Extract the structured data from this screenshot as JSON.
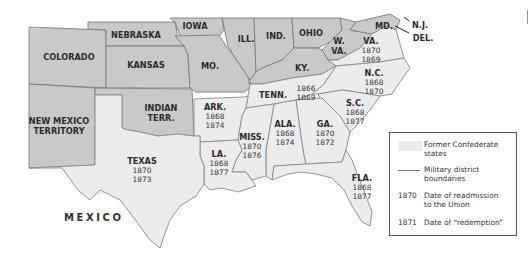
{
  "map": {
    "union_states": [
      {
        "id": "colorado",
        "label": "COLORADO"
      },
      {
        "id": "nebraska",
        "label": "NEBRASKA"
      },
      {
        "id": "iowa",
        "label": "IOWA"
      },
      {
        "id": "kansas",
        "label": "KANSAS"
      },
      {
        "id": "missouri",
        "label": "MO."
      },
      {
        "id": "illinois",
        "label": "ILL."
      },
      {
        "id": "indiana",
        "label": "IND."
      },
      {
        "id": "ohio",
        "label": "OHIO"
      },
      {
        "id": "west-virginia",
        "label_line1": "W.",
        "label_line2": "VA."
      },
      {
        "id": "kentucky",
        "label": "KY."
      },
      {
        "id": "maryland",
        "label": "MD."
      },
      {
        "id": "new-jersey",
        "label": "N.J."
      },
      {
        "id": "delaware",
        "label": "DEL."
      },
      {
        "id": "new-mexico",
        "label_line1": "NEW MEXICO",
        "label_line2": "TERRITORY"
      },
      {
        "id": "indian-territory",
        "label_line1": "INDIAN",
        "label_line2": "TERR."
      }
    ],
    "confederate_states": [
      {
        "id": "virginia",
        "label": "VA.",
        "readmission": "1870",
        "redemption": "1869"
      },
      {
        "id": "north-carolina",
        "label": "N.C.",
        "readmission": "1868",
        "redemption": "1870"
      },
      {
        "id": "tennessee",
        "label": "TENN.",
        "readmission": "1866",
        "redemption": "1869"
      },
      {
        "id": "south-carolina",
        "label": "S.C.",
        "readmission": "1868",
        "redemption": "1877"
      },
      {
        "id": "arkansas",
        "label": "ARK.",
        "readmission": "1868",
        "redemption": "1874"
      },
      {
        "id": "georgia",
        "label": "GA.",
        "readmission": "1870",
        "redemption": "1872"
      },
      {
        "id": "alabama",
        "label": "ALA.",
        "readmission": "1868",
        "redemption": "1874"
      },
      {
        "id": "mississippi",
        "label": "MISS.",
        "readmission": "1870",
        "redemption": "1876"
      },
      {
        "id": "louisiana",
        "label": "LA.",
        "readmission": "1868",
        "redemption": "1877"
      },
      {
        "id": "texas",
        "label": "TEXAS",
        "readmission": "1870",
        "redemption": "1873"
      },
      {
        "id": "florida",
        "label": "FLA.",
        "readmission": "1868",
        "redemption": "1877"
      }
    ],
    "other_labels": {
      "mexico": "MEXICO"
    },
    "colors": {
      "union_fill": "#c9c9c9",
      "confederate_fill": "#ececec",
      "border": "#7d7d7d"
    }
  },
  "legend": {
    "items": [
      {
        "key": "swatch",
        "text_line1": "Former Confederate",
        "text_line2": "states"
      },
      {
        "key": "line",
        "text_line1": "Military district",
        "text_line2": "boundaries"
      },
      {
        "key": "1870",
        "text_line1": "Date of readmission",
        "text_line2": "to the Union"
      },
      {
        "key": "1871",
        "text_line1": "Date of “redemption”",
        "text_line2": ""
      }
    ]
  }
}
